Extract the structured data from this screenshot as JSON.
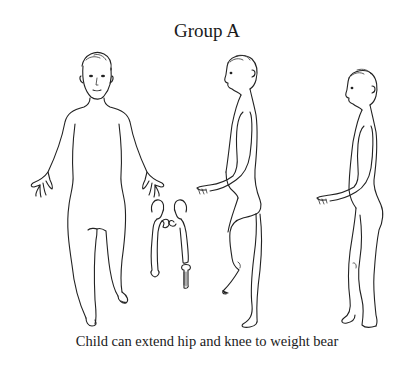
{
  "figure": {
    "title": "Group A",
    "caption": "Child can extend hip and knee to weight bear",
    "figures": [
      {
        "name": "front-view-child",
        "description": "Child standing, front view, one knee slightly flexed"
      },
      {
        "name": "hip-knee-bones",
        "description": "Skeletal sketch of pelvis, femurs and tibia"
      },
      {
        "name": "side-view-child-flexed",
        "description": "Child side view with one leg raised, hip and knee flexed"
      },
      {
        "name": "side-view-child-standing",
        "description": "Child side view standing with hip and knee extended"
      }
    ],
    "colors": {
      "line": "#222222",
      "background": "#ffffff"
    }
  }
}
